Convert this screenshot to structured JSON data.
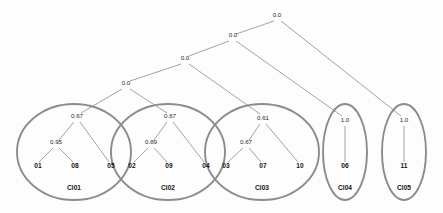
{
  "chart_data": {
    "type": "diagram",
    "title": "",
    "subtitle": "",
    "xlabel": "",
    "ylabel": "",
    "colors": {
      "background": "#fdfdfd",
      "edge": "#8a8a8a",
      "ellipse": "#8c8c8c",
      "text": "#141414",
      "value_text": "#2b2b2b"
    },
    "internal_nodes": [
      {
        "id": "root",
        "label": "0.0",
        "x": 277,
        "y": 17
      },
      {
        "id": "n2",
        "label": "0.0",
        "x": 233,
        "y": 37
      },
      {
        "id": "n3",
        "label": "0.0",
        "x": 185,
        "y": 60
      },
      {
        "id": "n4",
        "label": "0.0",
        "x": 126,
        "y": 85
      }
    ],
    "cluster_nodes": [
      {
        "id": "c1top",
        "label": "0.67",
        "x": 77,
        "y": 118
      },
      {
        "id": "c1sub",
        "label": "0.95",
        "x": 56,
        "y": 144
      },
      {
        "id": "c2top",
        "label": "0.67",
        "x": 170,
        "y": 118
      },
      {
        "id": "c2sub",
        "label": "0.89",
        "x": 151,
        "y": 144
      },
      {
        "id": "c3top",
        "label": "0.61",
        "x": 263,
        "y": 120
      },
      {
        "id": "c3sub",
        "label": "0.67",
        "x": 246,
        "y": 144
      },
      {
        "id": "c4top",
        "label": "1.0",
        "x": 345,
        "y": 122
      },
      {
        "id": "c5top",
        "label": "1.0",
        "x": 404,
        "y": 122
      }
    ],
    "leaves": [
      {
        "id": "l01",
        "label": "01",
        "x": 38,
        "y": 168
      },
      {
        "id": "l08",
        "label": "08",
        "x": 75,
        "y": 168
      },
      {
        "id": "l05",
        "label": "05",
        "x": 111,
        "y": 168
      },
      {
        "id": "l02",
        "label": "02",
        "x": 132,
        "y": 168
      },
      {
        "id": "l09",
        "label": "09",
        "x": 169,
        "y": 168
      },
      {
        "id": "l04",
        "label": "04",
        "x": 206,
        "y": 168
      },
      {
        "id": "l03",
        "label": "03",
        "x": 226,
        "y": 168
      },
      {
        "id": "l07",
        "label": "07",
        "x": 263,
        "y": 168
      },
      {
        "id": "l10",
        "label": "10",
        "x": 300,
        "y": 168
      },
      {
        "id": "l06",
        "label": "06",
        "x": 345,
        "y": 168
      },
      {
        "id": "l11",
        "label": "11",
        "x": 404,
        "y": 168
      }
    ],
    "edges": [
      {
        "from": "root",
        "to": "n2",
        "x1": 274,
        "y1": 21,
        "x2": 236,
        "y2": 34
      },
      {
        "from": "root",
        "to": "c5top",
        "x1": 281,
        "y1": 21,
        "x2": 401,
        "y2": 116
      },
      {
        "from": "n2",
        "to": "n3",
        "x1": 229,
        "y1": 41,
        "x2": 189,
        "y2": 56
      },
      {
        "from": "n2",
        "to": "c4top",
        "x1": 236,
        "y1": 41,
        "x2": 342,
        "y2": 116
      },
      {
        "from": "n3",
        "to": "n4",
        "x1": 181,
        "y1": 64,
        "x2": 130,
        "y2": 81
      },
      {
        "from": "n3",
        "to": "c3top",
        "x1": 189,
        "y1": 64,
        "x2": 260,
        "y2": 114
      },
      {
        "from": "n4",
        "to": "c1top",
        "x1": 122,
        "y1": 89,
        "x2": 81,
        "y2": 113
      },
      {
        "from": "n4",
        "to": "c2top",
        "x1": 130,
        "y1": 89,
        "x2": 167,
        "y2": 113
      },
      {
        "from": "c1top",
        "to": "c1sub",
        "x1": 74,
        "y1": 122,
        "x2": 59,
        "y2": 140
      },
      {
        "from": "c1top",
        "to": "l05",
        "x1": 80,
        "y1": 122,
        "x2": 109,
        "y2": 162
      },
      {
        "from": "c1sub",
        "to": "l01",
        "x1": 53,
        "y1": 148,
        "x2": 39,
        "y2": 162
      },
      {
        "from": "c1sub",
        "to": "l08",
        "x1": 59,
        "y1": 148,
        "x2": 73,
        "y2": 162
      },
      {
        "from": "c2top",
        "to": "c2sub",
        "x1": 167,
        "y1": 122,
        "x2": 154,
        "y2": 140
      },
      {
        "from": "c2top",
        "to": "l04",
        "x1": 173,
        "y1": 122,
        "x2": 204,
        "y2": 162
      },
      {
        "from": "c2sub",
        "to": "l02",
        "x1": 148,
        "y1": 148,
        "x2": 134,
        "y2": 162
      },
      {
        "from": "c2sub",
        "to": "l09",
        "x1": 154,
        "y1": 148,
        "x2": 167,
        "y2": 162
      },
      {
        "from": "c3top",
        "to": "c3sub",
        "x1": 260,
        "y1": 124,
        "x2": 249,
        "y2": 140
      },
      {
        "from": "c3top",
        "to": "l10",
        "x1": 266,
        "y1": 124,
        "x2": 298,
        "y2": 162
      },
      {
        "from": "c3sub",
        "to": "l03",
        "x1": 243,
        "y1": 148,
        "x2": 228,
        "y2": 162
      },
      {
        "from": "c3sub",
        "to": "l07",
        "x1": 249,
        "y1": 148,
        "x2": 261,
        "y2": 162
      },
      {
        "from": "c4top",
        "to": "l06",
        "x1": 345,
        "y1": 126,
        "x2": 345,
        "y2": 162
      },
      {
        "from": "c5top",
        "to": "l11",
        "x1": 404,
        "y1": 126,
        "x2": 404,
        "y2": 162
      }
    ],
    "clusters": [
      {
        "id": "Cl01",
        "label": "Cl01",
        "cx": 74,
        "cy": 152,
        "rx": 57,
        "ry": 48,
        "label_x": 74,
        "label_y": 190
      },
      {
        "id": "Cl02",
        "label": "Cl02",
        "cx": 168,
        "cy": 152,
        "rx": 57,
        "ry": 48,
        "label_x": 168,
        "label_y": 190
      },
      {
        "id": "Cl03",
        "label": "Cl03",
        "cx": 262,
        "cy": 152,
        "rx": 57,
        "ry": 48,
        "label_x": 262,
        "label_y": 190
      },
      {
        "id": "Cl04",
        "label": "Cl04",
        "cx": 345,
        "cy": 152,
        "rx": 22,
        "ry": 48,
        "label_x": 345,
        "label_y": 190
      },
      {
        "id": "Cl05",
        "label": "Cl05",
        "cx": 404,
        "cy": 152,
        "rx": 22,
        "ry": 48,
        "label_x": 404,
        "label_y": 190
      }
    ]
  }
}
